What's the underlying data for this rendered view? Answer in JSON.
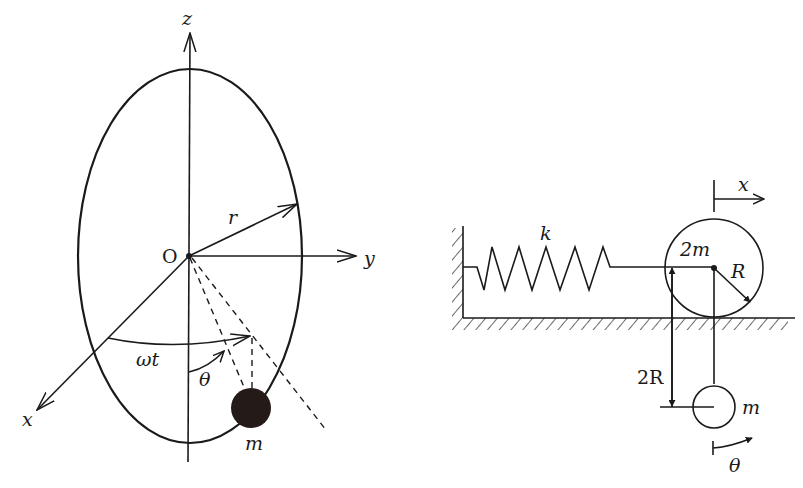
{
  "figure_left": {
    "title": "rotating elliptical hoop with bead",
    "labels": {
      "z_axis": "z",
      "y_axis": "y",
      "x_axis": "x",
      "origin": "O",
      "radius": "r",
      "rotation_angle": "ωt",
      "polar_angle": "θ",
      "mass": "m"
    }
  },
  "figure_right": {
    "title": "rolling disk with spring and pendulum",
    "labels": {
      "spring_constant": "k",
      "disk_mass": "2m",
      "disk_radius": "R",
      "displacement": "x",
      "pendulum_length": "2R",
      "pendulum_mass": "m",
      "pendulum_angle": "θ"
    }
  },
  "colors": {
    "ink": "#1a1a1a",
    "background": "#ffffff"
  }
}
